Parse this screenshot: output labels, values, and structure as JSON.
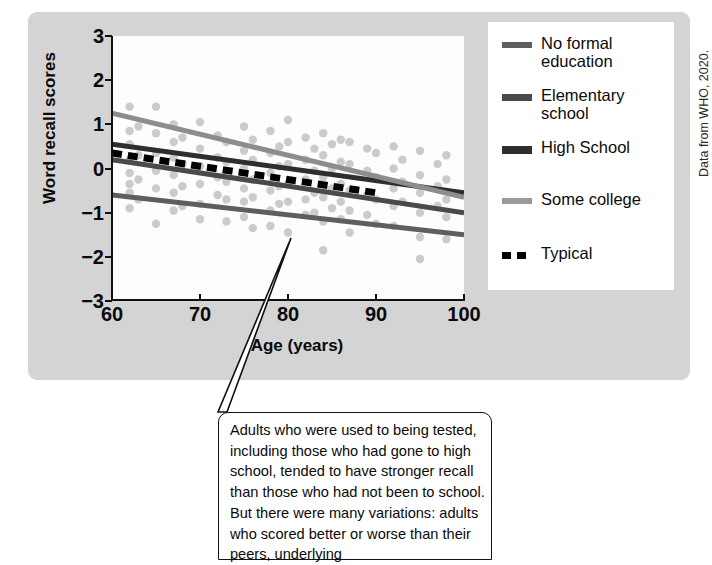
{
  "chart_data": {
    "type": "scatter",
    "title": "",
    "xlabel": "Age (years)",
    "ylabel": "Word recall scores",
    "xlim": [
      60,
      100
    ],
    "ylim": [
      -3,
      3
    ],
    "xticks": [
      60,
      70,
      80,
      90,
      100
    ],
    "yticks": [
      3,
      2,
      1,
      0,
      -1,
      -2,
      -3
    ],
    "ytick_labels": [
      "3",
      "2",
      "1",
      "0",
      "−1",
      "−2",
      "−3"
    ],
    "grid": false,
    "legend_position": "right",
    "series": [
      {
        "name": "No formal education",
        "type": "line",
        "color": "#5e5e5e",
        "style": "solid",
        "endpoints": [
          [
            60,
            -0.6
          ],
          [
            100,
            -1.5
          ]
        ]
      },
      {
        "name": "Elementary school",
        "type": "line",
        "color": "#4a4a4a",
        "style": "solid",
        "endpoints": [
          [
            60,
            0.2
          ],
          [
            100,
            -1.0
          ]
        ]
      },
      {
        "name": "High School",
        "type": "line",
        "color": "#2e2e2e",
        "style": "solid",
        "endpoints": [
          [
            60,
            0.55
          ],
          [
            100,
            -0.55
          ]
        ]
      },
      {
        "name": "Some college",
        "type": "line",
        "color": "#8d8d8d",
        "style": "solid",
        "endpoints": [
          [
            60,
            1.25
          ],
          [
            100,
            -0.65
          ]
        ]
      },
      {
        "name": "Typical",
        "type": "line",
        "color": "#000000",
        "style": "dashed",
        "endpoints": [
          [
            60,
            0.35
          ],
          [
            90,
            -0.55
          ]
        ]
      }
    ],
    "scatter": {
      "name": "Individual participants",
      "color": "#b9b9b9",
      "points": [
        [
          62,
          1.4
        ],
        [
          62,
          0.85
        ],
        [
          62,
          0.55
        ],
        [
          62,
          0.2
        ],
        [
          62,
          -0.1
        ],
        [
          62,
          -0.35
        ],
        [
          62,
          -0.55
        ],
        [
          62,
          -0.9
        ],
        [
          63,
          0.95
        ],
        [
          63,
          0.3
        ],
        [
          63,
          -0.25
        ],
        [
          63,
          -0.7
        ],
        [
          65,
          1.4
        ],
        [
          65,
          0.8
        ],
        [
          65,
          0.35
        ],
        [
          65,
          -0.05
        ],
        [
          65,
          -0.45
        ],
        [
          65,
          -1.25
        ],
        [
          67,
          1.0
        ],
        [
          67,
          0.6
        ],
        [
          67,
          0.25
        ],
        [
          67,
          -0.15
        ],
        [
          67,
          -0.55
        ],
        [
          67,
          -0.95
        ],
        [
          68,
          0.7
        ],
        [
          68,
          0.1
        ],
        [
          68,
          -0.4
        ],
        [
          68,
          -0.85
        ],
        [
          70,
          1.05
        ],
        [
          70,
          0.45
        ],
        [
          70,
          0.05
        ],
        [
          70,
          -0.35
        ],
        [
          70,
          -0.8
        ],
        [
          70,
          -1.15
        ],
        [
          72,
          0.75
        ],
        [
          72,
          0.25
        ],
        [
          72,
          -0.2
        ],
        [
          72,
          -0.6
        ],
        [
          73,
          0.6
        ],
        [
          73,
          0.15
        ],
        [
          73,
          -0.3
        ],
        [
          73,
          -0.7
        ],
        [
          73,
          -1.2
        ],
        [
          75,
          0.95
        ],
        [
          75,
          0.4
        ],
        [
          75,
          0.0
        ],
        [
          75,
          -0.45
        ],
        [
          75,
          -0.75
        ],
        [
          75,
          -1.1
        ],
        [
          76,
          0.65
        ],
        [
          76,
          0.2
        ],
        [
          76,
          -0.25
        ],
        [
          76,
          -0.65
        ],
        [
          76,
          -1.35
        ],
        [
          78,
          0.85
        ],
        [
          78,
          0.35
        ],
        [
          78,
          -0.1
        ],
        [
          78,
          -0.5
        ],
        [
          78,
          -0.95
        ],
        [
          78,
          -1.3
        ],
        [
          79,
          0.5
        ],
        [
          79,
          0.05
        ],
        [
          79,
          -0.4
        ],
        [
          79,
          -0.8
        ],
        [
          80,
          1.1
        ],
        [
          80,
          0.6
        ],
        [
          80,
          0.1
        ],
        [
          80,
          -0.35
        ],
        [
          80,
          -0.75
        ],
        [
          80,
          -1.45
        ],
        [
          82,
          0.7
        ],
        [
          82,
          0.2
        ],
        [
          82,
          -0.25
        ],
        [
          82,
          -0.7
        ],
        [
          82,
          -1.05
        ],
        [
          83,
          0.45
        ],
        [
          83,
          -0.05
        ],
        [
          83,
          -0.55
        ],
        [
          83,
          -1.0
        ],
        [
          84,
          0.8
        ],
        [
          84,
          0.3
        ],
        [
          84,
          -0.2
        ],
        [
          84,
          -0.65
        ],
        [
          84,
          -1.2
        ],
        [
          84,
          -1.85
        ],
        [
          85,
          0.55
        ],
        [
          85,
          0.0
        ],
        [
          85,
          -0.45
        ],
        [
          85,
          -0.9
        ],
        [
          86,
          0.65
        ],
        [
          86,
          0.15
        ],
        [
          86,
          -0.35
        ],
        [
          86,
          -0.75
        ],
        [
          86,
          -1.15
        ],
        [
          87,
          0.6
        ],
        [
          87,
          0.1
        ],
        [
          87,
          -0.5
        ],
        [
          87,
          -0.95
        ],
        [
          87,
          -1.45
        ],
        [
          89,
          0.45
        ],
        [
          89,
          -0.05
        ],
        [
          89,
          -0.6
        ],
        [
          89,
          -1.05
        ],
        [
          90,
          0.35
        ],
        [
          90,
          -0.2
        ],
        [
          90,
          -0.7
        ],
        [
          90,
          -1.25
        ],
        [
          92,
          0.5
        ],
        [
          92,
          0.0
        ],
        [
          92,
          -0.45
        ],
        [
          92,
          -0.85
        ],
        [
          92,
          -1.3
        ],
        [
          93,
          0.2
        ],
        [
          93,
          -0.3
        ],
        [
          93,
          -0.75
        ],
        [
          95,
          0.4
        ],
        [
          95,
          -0.15
        ],
        [
          95,
          -0.55
        ],
        [
          95,
          -1.0
        ],
        [
          95,
          -1.55
        ],
        [
          95,
          -2.05
        ],
        [
          97,
          0.1
        ],
        [
          97,
          -0.4
        ],
        [
          97,
          -0.85
        ],
        [
          98,
          0.3
        ],
        [
          98,
          -0.25
        ],
        [
          98,
          -0.7
        ],
        [
          98,
          -1.1
        ],
        [
          98,
          -1.6
        ]
      ]
    }
  },
  "legend": {
    "items": [
      {
        "label": "No formal\neducation",
        "color": "#5e5e5e",
        "style": "solid",
        "swatch_height": 6
      },
      {
        "label": "Elementary\nschool",
        "color": "#4a4a4a",
        "style": "solid",
        "swatch_height": 7
      },
      {
        "label": "High School",
        "color": "#2e2e2e",
        "style": "solid",
        "swatch_height": 8
      },
      {
        "label": "Some college",
        "color": "#9a9a9a",
        "style": "solid",
        "swatch_height": 6
      },
      {
        "label": "Typical",
        "color": "#000000",
        "style": "dashed",
        "swatch_height": 7
      }
    ]
  },
  "attribution": {
    "text": "Data from WHO, 2020."
  },
  "callout": {
    "text": "Adults who were used to being tested, including those who had gone to high school, tended to have stronger recall than those who had not been to school. But there were many variations: adults who scored better or worse than their peers, underlying"
  },
  "colors": {
    "panel_background": "#d4d4d4",
    "plot_background": "#fdfdfd",
    "axis": "#111111",
    "scatter": "#b9b9b9"
  }
}
